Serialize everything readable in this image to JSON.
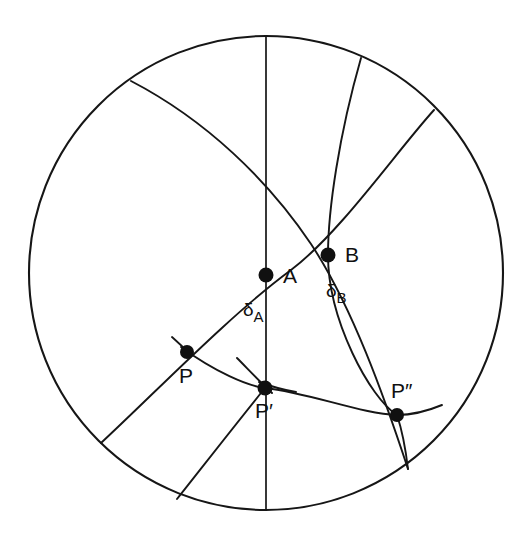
{
  "figure": {
    "domain_type": "diagram",
    "canvas": {
      "width": 529,
      "height": 544
    },
    "colors": {
      "ink": "#161616",
      "background": "#ffffff",
      "dot_fill": "#101010"
    }
  },
  "sphere": {
    "name": "sphere-outline",
    "center_x": 266,
    "center_y": 273,
    "radius": 237
  },
  "points": [
    {
      "id": "A",
      "label": "A",
      "x": 266,
      "y": 275,
      "label_x": 283,
      "label_y": 283,
      "radius": 7.5
    },
    {
      "id": "B",
      "label": "B",
      "x": 328,
      "y": 255,
      "label_x": 345,
      "label_y": 262,
      "radius": 7.5
    },
    {
      "id": "P",
      "label": "P",
      "x": 187,
      "y": 352,
      "label_x": 179,
      "label_y": 383,
      "radius": 7.0
    },
    {
      "id": "Pp",
      "label": "P",
      "prime": "′",
      "x": 265,
      "y": 388,
      "label_x": 255,
      "label_y": 418,
      "radius": 7.5
    },
    {
      "id": "Ppp",
      "label": "P",
      "prime": "″",
      "x": 397,
      "y": 415,
      "label_x": 391,
      "label_y": 398,
      "radius": 7.0
    }
  ],
  "arc_labels": [
    {
      "id": "delta_A",
      "glyph": "δ",
      "subscript": "A",
      "x": 243,
      "y": 316,
      "describes": "arc from P to A"
    },
    {
      "id": "delta_B",
      "glyph": "δ",
      "subscript": "B",
      "x": 326,
      "y": 297,
      "describes": "arc from B to P-prime"
    }
  ],
  "curves": {
    "meridian": {
      "name": "central-meridian",
      "path": "M 266 36 L 266 510"
    },
    "great_circle_nw_se": {
      "name": "great-circle-arc-northwest-southeast",
      "path": "M 131 81 C 206 120 268 180 311 244 C 352 306 384 396 408 469"
    },
    "line_p_a_b": {
      "name": "great-circle-arc-through-P-A-B",
      "path": "M 101 443 C 160 388 230 315 291 270 C 340 233 396 152 434 110"
    },
    "steep_arc_b": {
      "name": "great-circle-arc-through-B-and-Pdoubleprime",
      "path": "M 361 58 C 339 135 328 210 328 255 C 328 320 370 398 397 415 C 402 430 406 452 408 469"
    },
    "shallow_arc_ppp": {
      "name": "small-circle-arc-through-P-Pprime-Pdoubleprime",
      "path": "M 181 347 C 215 372 248 386 265 388 C 310 393 362 414 397 415 C 412 415 430 410 442 405"
    },
    "tick_at_p": {
      "name": "position-line-tick-at-P",
      "path": "M 172 337 C 178 342 184 348 190 355"
    },
    "tick_at_pprime_1": {
      "name": "position-line-tick-at-Pprime-left",
      "path": "M 237 358 C 247 368 257 379 272 393"
    },
    "tick_at_pprime_2": {
      "name": "position-line-tick-at-Pprime-right",
      "path": "M 259 382 C 270 386 283 390 296 392"
    },
    "exit_bottom_left": {
      "name": "great-circle-exit-bottom-left",
      "path": "M 265 388 C 235 425 200 470 177 499"
    }
  },
  "legend_note": {
    "visible": false,
    "text": ""
  }
}
